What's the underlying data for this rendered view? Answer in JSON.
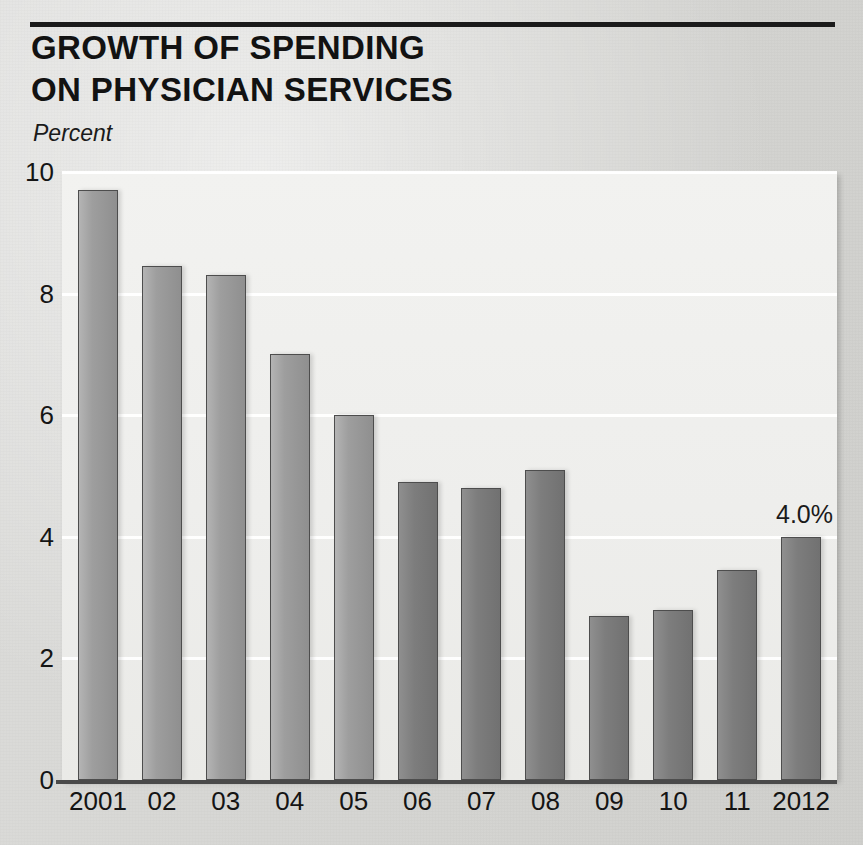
{
  "header": {
    "title_line1": "GROWTH OF SPENDING",
    "title_line2": "ON PHYSICIAN SERVICES",
    "axis_unit_label": "Percent"
  },
  "colors": {
    "page_background": "#d8d8d6",
    "plot_background": "#f0f0ee",
    "bar_light": "#a0a0a0",
    "bar_dark": "#7d7d7d",
    "bar_outline": "#4d4d4d",
    "text": "#141414",
    "rule": "#1b1b1b",
    "gridline": "#ffffff"
  },
  "chart_data": {
    "type": "bar",
    "title": "GROWTH OF SPENDING ON PHYSICIAN SERVICES",
    "subtitle": "Percent",
    "xlabel": "",
    "ylabel": "Percent",
    "categories": [
      "2001",
      "02",
      "03",
      "04",
      "05",
      "06",
      "07",
      "08",
      "09",
      "10",
      "11",
      "2012"
    ],
    "values": [
      9.7,
      8.45,
      8.3,
      7.0,
      6.0,
      4.9,
      4.8,
      5.1,
      2.7,
      2.8,
      3.45,
      4.0
    ],
    "ylim": [
      0,
      10
    ],
    "yticks": [
      0,
      2,
      4,
      6,
      8,
      10
    ],
    "ytick_labels": [
      "0",
      "2",
      "4",
      "6",
      "8",
      "10"
    ],
    "grid": true,
    "grid_axis": "y",
    "legend": false,
    "annotations": [
      {
        "category": "2012",
        "text": "4.0%",
        "value": 4.0
      }
    ]
  }
}
